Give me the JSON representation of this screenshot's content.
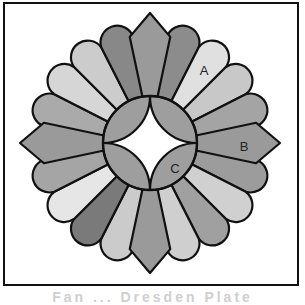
{
  "diagram": {
    "center": [
      150,
      143
    ],
    "petal_count": 20,
    "inner_radius": 47,
    "rounded_petal_radius": 110,
    "pointed_shoulder_radius": 108,
    "pointed_tip_radius": 130,
    "stroke_color": "#111111",
    "petals_clockwise_from_north": [
      {
        "type": "pointed",
        "fill": "#9a9a9a"
      },
      {
        "type": "rounded",
        "fill": "#8c8c8c"
      },
      {
        "type": "rounded",
        "fill": "#e0e0e0"
      },
      {
        "type": "rounded",
        "fill": "#c8c8c8"
      },
      {
        "type": "rounded",
        "fill": "#a4a4a4"
      },
      {
        "type": "pointed",
        "fill": "#9a9a9a"
      },
      {
        "type": "rounded",
        "fill": "#9c9c9c"
      },
      {
        "type": "rounded",
        "fill": "#d0d0d0"
      },
      {
        "type": "rounded",
        "fill": "#a0a0a0"
      },
      {
        "type": "rounded",
        "fill": "#cfcfcf"
      },
      {
        "type": "pointed",
        "fill": "#9a9a9a"
      },
      {
        "type": "rounded",
        "fill": "#cbcbcb"
      },
      {
        "type": "rounded",
        "fill": "#7a7a7a"
      },
      {
        "type": "rounded",
        "fill": "#e6e6e6"
      },
      {
        "type": "rounded",
        "fill": "#a5a5a5"
      },
      {
        "type": "pointed",
        "fill": "#9a9a9a"
      },
      {
        "type": "rounded",
        "fill": "#aaaaaa"
      },
      {
        "type": "rounded",
        "fill": "#d6d6d6"
      },
      {
        "type": "rounded",
        "fill": "#cccccc"
      },
      {
        "type": "rounded",
        "fill": "#888888"
      }
    ],
    "center_ring_fill": "#9e9e9e",
    "center_star_fill": "#ffffff",
    "labels": [
      {
        "text": "A",
        "x": 204,
        "y": 75
      },
      {
        "text": "B",
        "x": 244,
        "y": 151
      },
      {
        "text": "C",
        "x": 175,
        "y": 173
      }
    ]
  },
  "caption": "Fan ... Dresden Plate"
}
